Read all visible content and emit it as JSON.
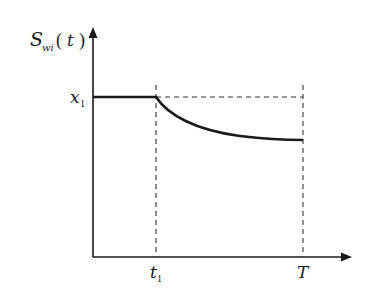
{
  "diagram": {
    "y_axis_label": {
      "main": "S",
      "subscript": "wi",
      "argument": "t"
    },
    "y_tick_label": {
      "main": "x",
      "subscript": "1"
    },
    "x_tick_labels": [
      {
        "main": "t",
        "subscript": "1"
      },
      {
        "main": "T",
        "subscript": ""
      }
    ],
    "colors": {
      "axis": "#1a1a1a",
      "curve": "#1a1a1a",
      "dashed": "#333333",
      "background": "#ffffff"
    }
  }
}
